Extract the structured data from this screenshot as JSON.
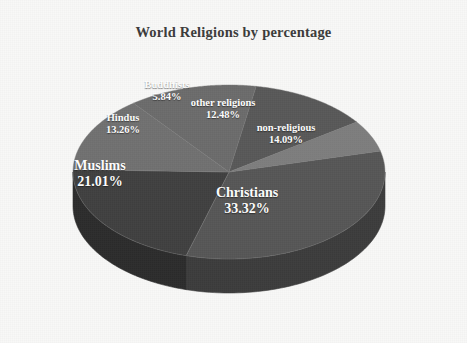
{
  "chart_data": {
    "type": "pie",
    "title": "World Religions by percentage",
    "xlabel": "",
    "ylabel": "",
    "legend_position": "none",
    "grid": false,
    "three_d": true,
    "value_unit": "%",
    "categories": [
      "Christians",
      "Muslims",
      "non-religious",
      "Hindus",
      "other religions",
      "Buddhists"
    ],
    "values": [
      33.32,
      21.01,
      14.09,
      13.26,
      12.48,
      5.84
    ],
    "slices": [
      {
        "label": "Christians",
        "value": 33.32,
        "value_text": "33.32%",
        "color": "#565656",
        "side_color": "#3c3c3c",
        "label_x": 247,
        "label_y": 185,
        "font_size": 14
      },
      {
        "label": "Muslims",
        "value": 21.01,
        "value_text": "21.01%",
        "color": "#404040",
        "side_color": "#2c2c2c",
        "label_x": 100,
        "label_y": 158,
        "font_size": 14
      },
      {
        "label": "non-religious",
        "value": 14.09,
        "value_text": "14.09%",
        "color": "#707070",
        "side_color": "#4e4e4e",
        "label_x": 286,
        "label_y": 122,
        "font_size": 10.5
      },
      {
        "label": "Hindus",
        "value": 13.26,
        "value_text": "13.26%",
        "color": "#6b6b6b",
        "side_color": "#4a4a4a",
        "label_x": 123,
        "label_y": 112,
        "font_size": 10.5
      },
      {
        "label": "other religions",
        "value": 12.48,
        "value_text": "12.48%",
        "color": "#585858",
        "side_color": "#3e3e3e",
        "label_x": 223,
        "label_y": 97,
        "font_size": 10.5
      },
      {
        "label": "Buddhists",
        "value": 5.84,
        "value_text": "5.84%",
        "color": "#7d7d7d",
        "side_color": "#585858",
        "label_x": 167,
        "label_y": 79,
        "font_size": 10.5
      }
    ],
    "background_color": "#f8f8f7",
    "title_color": "#3b3b3b",
    "label_color": "#ffffff"
  }
}
